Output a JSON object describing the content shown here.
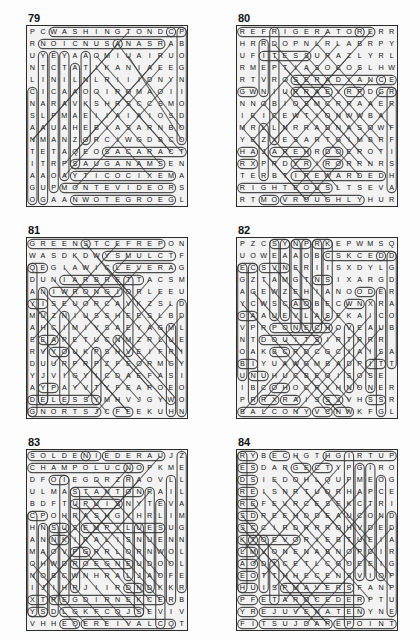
{
  "page": {
    "background_color": "#fdfdfd",
    "grid_fill_color": "#f2f2f2",
    "grid_border_color": "#2b2b2b",
    "letter_color": "#111111",
    "marker_color": "#3a3a3a"
  },
  "puzzles": [
    {
      "number": "79",
      "rows": 15,
      "cols": 19,
      "grid": [
        "PCWASHINGTONDCP",
        "RNOICNUSANASRAB",
        "UYEYAAOMIUAIRUO",
        "NTCTATIKANIAEEG",
        "LINILNLRIIIDNYN",
        "CICAAOOIROMAOII",
        "NARAVKSHRSCCSMO",
        "SLPMAEIIAIAIOSD",
        "AAUAHEBIASARNBO",
        "NMANZORCIWGDBCO",
        "TETAQEOSACARACT",
        "ITRPSAUGANAMSEN",
        "AAOAYTICOCIXEMA",
        "GUPMONTEVIDEORS",
        "OGAANWOTEGROEGL"
      ],
      "found_words": [
        "WASHINGTONDC",
        "ASUNCION",
        "SANSALVADOR",
        "CARACAS",
        "MANAGUA",
        "MEXICOCITY",
        "MONTEVIDEO",
        "GEORGETOWN",
        "SANTIAGO",
        "LIMA",
        "QUITO",
        "HAVANA",
        "BOGOTA",
        "PANAMA"
      ]
    },
    {
      "number": "80",
      "rows": 15,
      "cols": 19,
      "grid": [
        "REFRIGERATORERR",
        "HRRDOPNLRLABRPY",
        "UFITESSURAZLYRL",
        "RMEPTIASOCOSLHW",
        "RTVROSERADIANCE",
        "GWNIURRAEYRPDGR",
        "NNOBIOSMCRRAAER",
        "IEICEWTIONWWBA",
        "MRLLNRRADNASOWF",
        "YEZXESARTGIMBRF",
        "HAJAREHRDOEROTI",
        "RXPRDYRIRORRNRS",
        "TERBTIREWARDEDH",
        "RIGHTEOUSLTSEVA",
        "RTMOVROUGHLYHUR"
      ],
      "found_words": [
        "REFRIGERATOR",
        "RADIANCE",
        "REWARDED",
        "RIGHTEOUS",
        "ROUGHLY",
        "REASSURE",
        "RESERVOIR",
        "REPROACH",
        "REGRET",
        "RAMBLE",
        "RIBBON"
      ]
    },
    {
      "number": "81",
      "rows": 15,
      "cols": 19,
      "grid": [
        "GREENSTCEFREPON",
        "WASDKDWYSMULCTF",
        "QEGIAWICLEVERAG",
        "DUNIARBRETTACSM",
        "ANIWRONGIORLEEU",
        "YISEUORCAVKZSLD",
        "MUZNIUSSHEESLBD",
        "AHCIMIYSAEYAGML",
        "EEAPETUCNMZRLUE",
        "RVYOUKPSHVEIFRI",
        "DUURPRPZFEORMGY",
        "YJVIGYICDAEFASI",
        "AYPAYVTYFEAROEO",
        "DELESSYMHVJGYWO",
        "GNORTSJCFEEKUHN"
      ],
      "found_words": [
        "GREENS",
        "PERFECT",
        "CLUMSY",
        "CLEVER",
        "BRAINIER",
        "SCATTER",
        "WRONG",
        "STRONG",
        "USELESS",
        "SHEEPISH",
        "CURIOUS",
        "BRAVE"
      ]
    },
    {
      "number": "82",
      "rows": 15,
      "cols": 19,
      "grid": [
        "PZCSYNPRKEPWMSQ",
        "UOWEAAOBCSKCEDD",
        "ECSVNERIISXDYLG",
        "GZTAMGTNSIXARGD",
        "AGEWZEHIANOODER",
        "YCWSCAOBECWNXRA",
        "OAAUEVLASEKAICO",
        "VPRPONECHOVEAUB",
        "NTDOUITSIRTRRR",
        "OAKBCRDCGCIAISA",
        "BIYUAWGMBADPITT",
        "UNUHUCBEOISOSE",
        "IBCOHOCRYHNONER",
        "PRRXRAISSJVHSSR",
        "BALCONYVCNWKFGL"
      ],
      "found_words": [
        "BALCONY",
        "DECKS",
        "PORCHES",
        "VERANDA",
        "DOORWAYS",
        "STAIRCASE",
        "COURTYARD",
        "GARAGE",
        "PATIO",
        "ARBOR",
        "CANOPY",
        "AWNING"
      ]
    },
    {
      "number": "83",
      "rows": 15,
      "cols": 19,
      "grid": [
        "SOLDENIEDERAUJZ",
        "CHAMPOLUCNOPKME",
        "DFOIEGDRZRAOVLL",
        "ULMASTANTONRAIL",
        "BDFTUPUISNYTEVA",
        "CPOHRASHGYHRLIM",
        "HNSUSEMPILUESUG",
        "ANNKIRALISNUENN",
        "MAOVPGRRLORNWOL",
        "OHWDROEGNEUDOOL",
        "NOBCWNHRALJAOFE",
        "IJIHRJIIRDNDKKR",
        "XTREGDIRNEKCERB",
        "YSDLGKFCQJSEVIV",
        "VHHEQEREIVALCQT"
      ],
      "found_words": [
        "SOLDEN",
        "NIEDERAU",
        "CHAMPOLUC",
        "STANTON",
        "CLAVIERE",
        "BRECKENRIDGE",
        "SELVA",
        "MORZINE",
        "KILLINGTON",
        "ZERMATT"
      ]
    },
    {
      "number": "84",
      "rows": 15,
      "cols": 19,
      "grid": [
        "RYBECHGTHGIRTUP",
        "ESDARGECTYPGIRO",
        "DSIEDOHLQUPMEOG",
        "REISNRTUORHAPCE",
        "REFEVRCESEKCTRI",
        "SDREEHDDEAUCOND",
        "SCCIRDRRROHVDED",
        "KTOEVORIEBTUEIA",
        "LMVONENABNOPDIR",
        "AODICETLCGOEEIG",
        "EOTTHHECENSVIOP",
        "HUISPMAVERSFANP",
        "PFETAROCEDERPTU",
        "YREJUVENATENYNE",
        "FITSUJDAREPOINT"
      ],
      "found_words": [
        "UPRIGHT",
        "REVAMP",
        "REDECORATE",
        "REJUVENATE",
        "REPOINT",
        "ADJUST",
        "RECONDITION",
        "REPAIR",
        "RENOVATE",
        "UPGRADE",
        "RESTORE"
      ]
    }
  ]
}
